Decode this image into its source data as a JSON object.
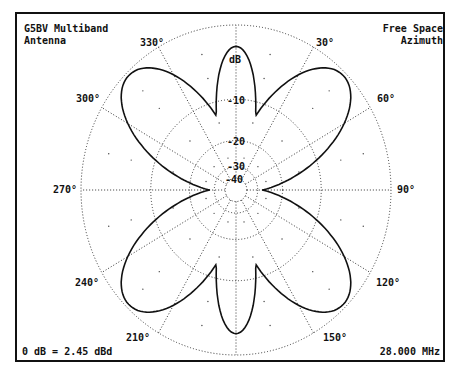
{
  "chart_data": {
    "type": "polar",
    "title_lines": [
      "G5BV Multiband",
      "Antenna"
    ],
    "subtitle_lines": [
      "Free Space",
      "Azimuth"
    ],
    "reference": "0 dB = 2.45 dBd",
    "frequency": "28.000 MHz",
    "radial_unit": "dB",
    "radial_ticks": [
      {
        "label": "dB",
        "value": 0,
        "frac": 1.0
      },
      {
        "label": "-10",
        "value": -10,
        "frac": 0.55
      },
      {
        "label": "-20",
        "value": -20,
        "frac": 0.3
      },
      {
        "label": "-30",
        "value": -30,
        "frac": 0.14
      },
      {
        "label": "-40",
        "value": -40,
        "frac": 0.07
      }
    ],
    "angle_labels": [
      "0°",
      "30°",
      "60°",
      "90°",
      "120°",
      "150°",
      "180°",
      "210°",
      "240°",
      "270°",
      "300°",
      "330°"
    ],
    "visible_angle_labels": [
      {
        "angle": 330,
        "text": "330°"
      },
      {
        "angle": 30,
        "text": "30°"
      },
      {
        "angle": 300,
        "text": "300°"
      },
      {
        "angle": 60,
        "text": "60°"
      },
      {
        "angle": 270,
        "text": "270°"
      },
      {
        "angle": 90,
        "text": "90°"
      },
      {
        "angle": 240,
        "text": "240°"
      },
      {
        "angle": 120,
        "text": "120°"
      },
      {
        "angle": 210,
        "text": "210°"
      },
      {
        "angle": 150,
        "text": "150°"
      }
    ],
    "grid": true,
    "lobes": [
      {
        "azimuth": 0,
        "peak_db": -1.5,
        "peak_frac": 0.87,
        "width_deg": 14
      },
      {
        "azimuth": 45,
        "peak_db": 0,
        "peak_frac": 0.98,
        "width_deg": 24
      },
      {
        "azimuth": 135,
        "peak_db": 0,
        "peak_frac": 0.98,
        "width_deg": 24
      },
      {
        "azimuth": 180,
        "peak_db": -1.5,
        "peak_frac": 0.87,
        "width_deg": 14
      },
      {
        "azimuth": 225,
        "peak_db": 0,
        "peak_frac": 0.98,
        "width_deg": 24
      },
      {
        "azimuth": 315,
        "peak_db": 0,
        "peak_frac": 0.98,
        "width_deg": 24
      }
    ],
    "nulls": [
      90,
      270
    ]
  }
}
